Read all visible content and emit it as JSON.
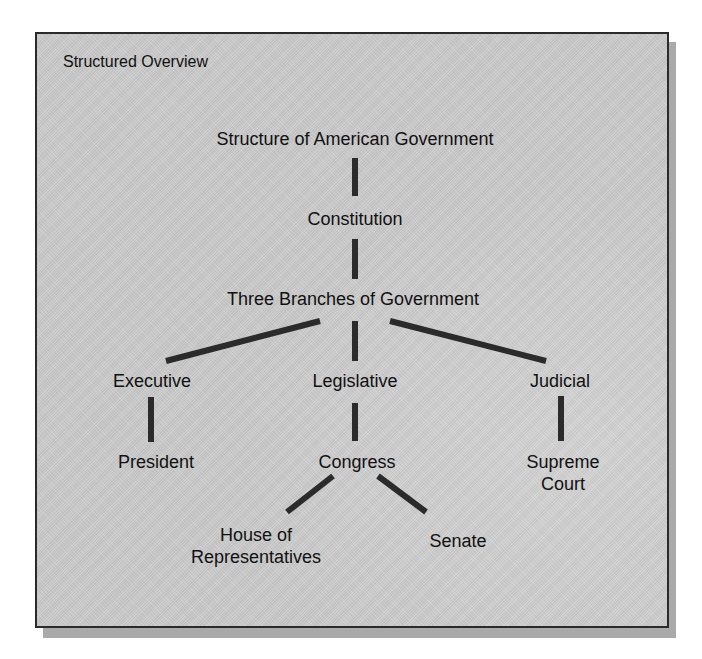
{
  "panel": {
    "title": "Structured Overview"
  },
  "tree": {
    "root": "Structure of American Government",
    "level1": "Constitution",
    "level2": "Three Branches of Government",
    "branches": {
      "executive": {
        "label": "Executive",
        "child": "President"
      },
      "legislative": {
        "label": "Legislative",
        "child": "Congress",
        "subchildren": {
          "house_line1": "House of",
          "house_line2": "Representatives",
          "senate": "Senate"
        }
      },
      "judicial": {
        "label": "Judicial",
        "child_line1": "Supreme",
        "child_line2": "Court"
      }
    }
  },
  "colors": {
    "panel_background": "#c9c9c9",
    "panel_border": "#2a2a2a",
    "shadow": "#a9a9a9",
    "connector": "#2b2b2b",
    "text": "#111111"
  }
}
